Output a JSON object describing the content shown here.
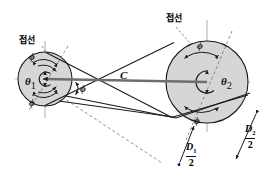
{
  "figure": {
    "type": "mechanical-engineering-diagram",
    "background_color": "#ffffff",
    "line_color": "#1a1a1a",
    "pulley_fill_color": "#d4d4d4",
    "axis_color": "#8a8a8a"
  },
  "labels": {
    "tangent_left": "접선",
    "tangent_right": "접선",
    "center_distance": "C",
    "theta_1": "θ",
    "theta_1_sub": "1",
    "theta_2": "θ",
    "theta_2_sub": "2",
    "phi_upper_left": "ϕ",
    "phi_lower_left": "ϕ",
    "phi_center": "ϕ",
    "phi_upper_right": "ϕ",
    "phi_lower_right": "ϕ",
    "radius_small_num": "D",
    "radius_small_sub": "1",
    "radius_small_den": "2",
    "radius_large_num": "D",
    "radius_large_sub": "2",
    "radius_large_den": "2"
  },
  "geometry": {
    "small_pulley": {
      "cx": 45,
      "cy": 79,
      "r": 27,
      "hub_r": 7
    },
    "large_pulley": {
      "cx": 207,
      "cy": 82,
      "r": 41,
      "hub_r": 11
    },
    "crossing_point": {
      "x": 101,
      "y": 79
    },
    "center_line": {
      "x1": 45,
      "y1": 79,
      "x2": 207,
      "y2": 82
    }
  }
}
